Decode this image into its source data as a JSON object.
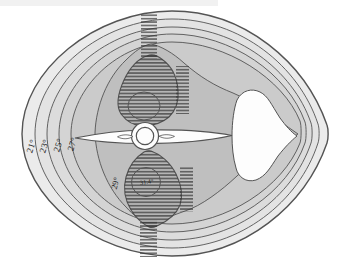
{
  "figure": {
    "labels": {
      "iso21": "21°",
      "iso23": "23°",
      "iso25": "25°",
      "iso27": "27°",
      "iso29": "29°",
      "core_max": "31.4°"
    },
    "isotherm_values": [
      21,
      23,
      25,
      27,
      29
    ],
    "core_max_value": 31.4
  },
  "colors": {
    "page_bg": "#ffffff",
    "page_edge_shade": "#e9e9e9",
    "outline_stroke": "#4a4a4a",
    "contour_stroke": "#545454",
    "hatch": "#383838",
    "label_text": "#1c1c1c",
    "band_body": "#ebebeb",
    "band_21": "#e3e3e3",
    "band_23": "#dcdcdc",
    "band_25": "#d4d4d4",
    "band_27": "#cbcbcb",
    "band_29": "#bfbfbf",
    "band_core": "#b5b5b5",
    "white_structure": "#fdfdfd"
  }
}
